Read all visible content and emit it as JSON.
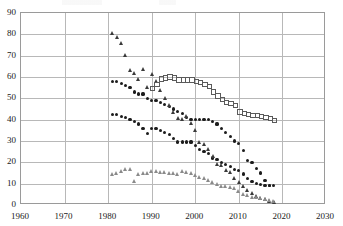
{
  "chart_data": {
    "type": "scatter",
    "title": "",
    "subtitle": "",
    "xlabel": "",
    "ylabel": "",
    "xlim": [
      1960,
      2030
    ],
    "ylim": [
      0,
      90
    ],
    "xticks": [
      1960,
      1970,
      1980,
      1990,
      2000,
      2010,
      2020,
      2030
    ],
    "yticks": [
      0,
      10,
      20,
      30,
      40,
      50,
      60,
      70,
      80,
      90
    ],
    "grid": true,
    "legend": "none",
    "marker_colors": {
      "filled_circle": "#1c1c1c",
      "filled_triangle": "#3a3a3a",
      "open_square": "#5a5a5a",
      "open_triangle": "#8a8a8a",
      "gridline": "#b8b8b8",
      "axis": "#9a9a9a"
    },
    "series": [
      {
        "name": "Upper filled-circle series",
        "marker": "filled-circle",
        "x": [
          1981,
          1982,
          1983,
          1984,
          1985,
          1986,
          1987,
          1988,
          1989,
          1990,
          1991,
          1992,
          1993,
          1994,
          1995,
          1996,
          1997,
          1998,
          1999,
          2000,
          2001,
          2002,
          2003,
          2004,
          2005,
          2006,
          2007,
          2008,
          2009,
          2010,
          2011,
          2012,
          2013,
          2014,
          2015,
          2016,
          2017,
          2018
        ],
        "values": [
          58,
          58,
          57,
          56,
          55,
          53,
          52,
          52,
          50,
          49,
          49,
          48,
          47,
          46,
          45,
          44,
          43,
          41,
          40,
          40,
          40,
          40,
          40,
          39,
          38,
          36,
          34,
          32,
          30,
          29,
          25.5,
          21,
          20,
          17,
          15,
          11.5,
          9,
          9
        ]
      },
      {
        "name": "Lower filled-circle series",
        "marker": "filled-circle",
        "x": [
          1981,
          1982,
          1983,
          1984,
          1985,
          1986,
          1987,
          1988,
          1989,
          1990,
          1991,
          1992,
          1993,
          1994,
          1995,
          1996,
          1997,
          1998,
          1999,
          2000,
          2001,
          2002,
          2003,
          2004,
          2005,
          2006,
          2007,
          2008,
          2009,
          2010,
          2011,
          2012,
          2013,
          2014,
          2015,
          2016,
          2017
        ],
        "values": [
          42.5,
          42.5,
          41.5,
          41,
          40,
          39,
          38,
          36,
          33.5,
          36,
          36,
          35,
          34,
          33,
          31,
          29.5,
          29.5,
          29.5,
          29.5,
          28,
          26,
          25,
          24,
          22,
          21.5,
          20,
          19,
          18,
          16.5,
          16,
          14.5,
          12.5,
          11,
          10,
          9.5,
          9,
          9
        ]
      },
      {
        "name": "Filled-triangle series",
        "marker": "filled-triangle",
        "x": [
          1981,
          1982,
          1983,
          1984,
          1985,
          1986,
          1987,
          1988,
          1989,
          1990,
          1991,
          1992,
          1993,
          1994,
          1995,
          1996,
          1997,
          1998,
          1999,
          2000,
          2001,
          2002,
          2003,
          2004,
          2005,
          2006,
          2007,
          2008,
          2009,
          2010,
          2011,
          2012,
          2013,
          2014,
          2015,
          2016,
          2017,
          2018
        ],
        "values": [
          80,
          78,
          75,
          69.5,
          62.5,
          61,
          58.5,
          63,
          54.5,
          60.5,
          57.5,
          53,
          49.5,
          46,
          43,
          40,
          39.5,
          41,
          37.5,
          34.5,
          29,
          28,
          25.5,
          22,
          18.5,
          18,
          15.5,
          14.5,
          12,
          10,
          8,
          6.5,
          5,
          3.5,
          2.5,
          2,
          1,
          0.5
        ]
      },
      {
        "name": "Open-square series",
        "marker": "open-square",
        "x": [
          1990,
          1991,
          1992,
          1993,
          1994,
          1995,
          1996,
          1997,
          1998,
          1999,
          2000,
          2001,
          2002,
          2003,
          2004,
          2005,
          2006,
          2007,
          2008,
          2009,
          2010,
          2011,
          2012,
          2013,
          2014,
          2015,
          2016,
          2017,
          2018
        ],
        "values": [
          55,
          57,
          59.5,
          60,
          60.5,
          60,
          59,
          59,
          59,
          59,
          58.5,
          58,
          57,
          56,
          53.5,
          51.5,
          50,
          48.5,
          48,
          47,
          44,
          43.5,
          43,
          42.5,
          42.5,
          42,
          41.5,
          41,
          40
        ]
      },
      {
        "name": "Open-triangle series",
        "marker": "open-triangle",
        "x": [
          1981,
          1982,
          1983,
          1984,
          1985,
          1986,
          1987,
          1988,
          1989,
          1990,
          1991,
          1992,
          1993,
          1994,
          1995,
          1996,
          1997,
          1998,
          1999,
          2000,
          2001,
          2002,
          2003,
          2004,
          2005,
          2006,
          2007,
          2008,
          2009,
          2010,
          2011,
          2012,
          2013,
          2014,
          2015,
          2016,
          2017,
          2018
        ],
        "values": [
          13.5,
          14,
          15,
          16,
          16,
          10.5,
          13.5,
          14,
          14,
          15,
          15,
          14.5,
          14.5,
          14,
          14,
          13.5,
          15,
          14.5,
          14,
          13,
          12.5,
          12,
          11,
          10,
          9,
          8,
          8,
          7.5,
          7,
          5.5,
          4.5,
          4,
          3,
          3,
          2.5,
          2,
          1.5,
          1
        ]
      }
    ]
  }
}
